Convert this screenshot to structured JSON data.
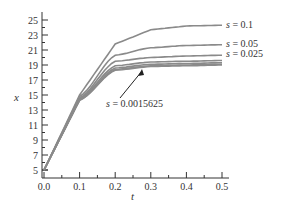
{
  "chart_data": {
    "type": "line",
    "title": "",
    "xlabel": "t",
    "ylabel": "x",
    "xlim": [
      0.0,
      0.5
    ],
    "ylim": [
      4,
      26
    ],
    "grid": false,
    "x_ticks": [
      "0.0",
      "0.1",
      "0.2",
      "0.3",
      "0.4",
      "0.5"
    ],
    "y_ticks": [
      "5",
      "7",
      "9",
      "11",
      "13",
      "15",
      "17",
      "19",
      "21",
      "23",
      "25"
    ],
    "x": [
      0.0,
      0.1,
      0.2,
      0.3,
      0.4,
      0.5
    ],
    "series": [
      {
        "name": "s = 0.1",
        "values": [
          5.0,
          15.0,
          21.8,
          23.7,
          24.2,
          24.3
        ]
      },
      {
        "name": "s = 0.05",
        "values": [
          5.0,
          14.8,
          20.3,
          21.3,
          21.6,
          21.7
        ]
      },
      {
        "name": "s = 0.025",
        "values": [
          5.0,
          14.6,
          19.5,
          20.0,
          20.2,
          20.3
        ]
      },
      {
        "name": "s = 0.0125",
        "values": [
          5.0,
          14.5,
          18.9,
          19.4,
          19.5,
          19.6
        ]
      },
      {
        "name": "s = 0.00625",
        "values": [
          5.0,
          14.4,
          18.6,
          19.1,
          19.2,
          19.3
        ]
      },
      {
        "name": "s = 0.003125",
        "values": [
          5.0,
          14.3,
          18.4,
          18.9,
          19.0,
          19.1
        ]
      },
      {
        "name": "s = 0.0015625",
        "values": [
          5.0,
          14.3,
          18.3,
          18.8,
          18.9,
          19.0
        ]
      }
    ],
    "annotations": [
      {
        "text": "s = 0.1",
        "position": "end of top curve"
      },
      {
        "text": "s = 0.05",
        "position": "end of second curve"
      },
      {
        "text": "s = 0.025",
        "position": "end of third curve"
      },
      {
        "text": "s = 0.0015625",
        "position": "below curves with arrow pointing to lowest curve"
      }
    ],
    "legend_position": "inline labels at right"
  },
  "labels": {
    "s01_var": "s",
    "s01_val": " = 0.1",
    "s005_var": "s",
    "s005_val": " = 0.05",
    "s0025_var": "s",
    "s0025_val": " = 0.025",
    "smin_var": "s",
    "smin_val": " = 0.0015625",
    "xlabel": "t",
    "ylabel": "x"
  }
}
